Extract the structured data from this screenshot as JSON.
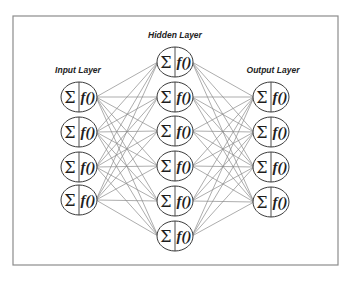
{
  "diagram": {
    "colors": {
      "frame": "#8c8c8c",
      "connections": "#8a8a8a",
      "node_stroke": "#3a3a3a",
      "text": "#1e1e1e"
    },
    "node_label": {
      "sum_symbol": "Σ",
      "function": "f()"
    },
    "layers": [
      {
        "id": "input",
        "label": "Input Layer",
        "label_x": 78,
        "label_y": 73,
        "x": 79,
        "nodes_y": [
          97,
          132,
          167,
          200
        ]
      },
      {
        "id": "hidden",
        "label": "Hidden Layer",
        "label_x": 175,
        "label_y": 38,
        "x": 175,
        "nodes_y": [
          62,
          97,
          131,
          166,
          201,
          236
        ]
      },
      {
        "id": "output",
        "label": "Output Layer",
        "label_x": 273,
        "label_y": 73,
        "x": 271,
        "nodes_y": [
          97,
          132,
          167,
          202
        ]
      }
    ],
    "node_size": {
      "rx": 18,
      "ry": 15
    },
    "frame": {
      "x": 13,
      "y": 16,
      "width": 325,
      "height": 249
    }
  }
}
